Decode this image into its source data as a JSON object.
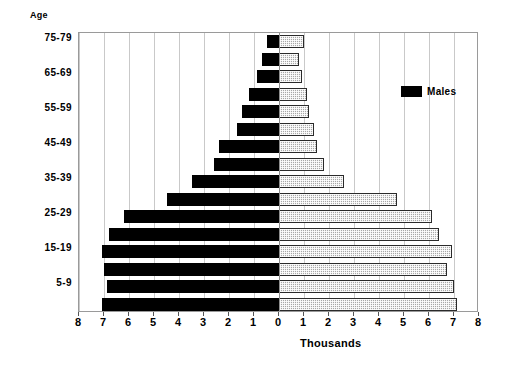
{
  "chart_data": {
    "type": "bar",
    "subtype": "population-pyramid",
    "title": "",
    "xlabel": "Thousands",
    "ylabel": "Age",
    "xlim": [
      -8,
      8
    ],
    "xticks": [
      8,
      7,
      6,
      5,
      4,
      3,
      2,
      1,
      0,
      1,
      2,
      3,
      4,
      5,
      6,
      7,
      8
    ],
    "grid": true,
    "legend_position": "top-right",
    "categories": [
      "0-4",
      "5-9",
      "10-14",
      "15-19",
      "20-24",
      "25-29",
      "30-34",
      "35-39",
      "40-44",
      "45-49",
      "50-54",
      "55-59",
      "60-64",
      "65-69",
      "70-74",
      "75-79"
    ],
    "visible_ytick_labels": [
      "5-9",
      "15-19",
      "25-29",
      "35-39",
      "45-49",
      "55-59",
      "65-69",
      "75-79"
    ],
    "series": [
      {
        "name": "Males",
        "color": "#000000",
        "side": "left",
        "values": [
          7.1,
          6.9,
          7.0,
          7.1,
          6.8,
          6.2,
          4.5,
          3.5,
          2.6,
          2.4,
          1.7,
          1.5,
          1.2,
          0.9,
          0.7,
          0.5
        ]
      },
      {
        "name": "Females",
        "color": "#a8a8a8",
        "side": "right",
        "values": [
          7.1,
          7.0,
          6.7,
          6.9,
          6.4,
          6.1,
          4.7,
          2.6,
          1.8,
          1.5,
          1.4,
          1.2,
          1.1,
          0.9,
          0.8,
          1.0
        ]
      }
    ]
  },
  "legend": {
    "entries": [
      {
        "label": "Males",
        "swatch": "male-swatch"
      },
      {
        "label": "Females",
        "swatch": "female-swatch"
      }
    ]
  },
  "axes": {
    "age_title": "Age",
    "x_title": "Thousands"
  },
  "colors": {
    "male": "#000000",
    "female": "#a8a8a8",
    "frame": "#9a9a9a",
    "grid": "#c9c9c9",
    "zero_line": "#8d8d8d",
    "background": "#ffffff"
  }
}
